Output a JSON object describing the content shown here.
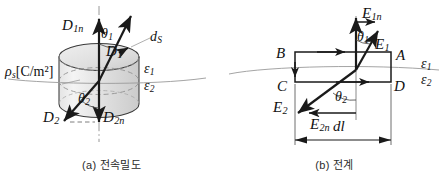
{
  "figure": {
    "panels": [
      {
        "id": "a",
        "caption": "(a) 전속밀도",
        "labels": {
          "d1n": "D",
          "d1n_sub": "1n",
          "theta1": "θ",
          "theta1_sub": "1",
          "d1": "D",
          "d1_sub": "1",
          "ds": "d",
          "ds_sub": "S",
          "rho_s": "ρ",
          "rho_s_sub": "s",
          "rho_units": "[C/m²]",
          "eps1": "ε",
          "eps1_sub": "1",
          "eps2": "ε",
          "eps2_sub": "2",
          "d2": "D",
          "d2_sub": "2",
          "theta2": "θ",
          "theta2_sub": "2",
          "d2n": "D",
          "d2n_sub": "2n"
        }
      },
      {
        "id": "b",
        "caption": "(b) 전계",
        "labels": {
          "e1n": "E",
          "e1n_sub": "1n",
          "theta1": "θ",
          "theta1_sub": "1",
          "e1": "E",
          "e1_sub": "1",
          "pt_b": "B",
          "pt_a": "A",
          "pt_c": "C",
          "pt_d": "D",
          "eps1": "ε",
          "eps1_sub": "1",
          "eps2": "ε",
          "eps2_sub": "2",
          "e2": "E",
          "e2_sub": "2",
          "theta2": "θ",
          "theta2_sub": "2",
          "e2n": "E",
          "e2n_sub": "2n",
          "dl": "dl"
        }
      }
    ],
    "colors": {
      "stroke": "#1a1a1a",
      "cylinder_fill_light": "#f0f0f0",
      "cylinder_fill_dark": "#cfcfcf",
      "boundary_line": "#9a9a9a",
      "dash_axis": "#8c8c8c",
      "background": "#ffffff"
    }
  }
}
